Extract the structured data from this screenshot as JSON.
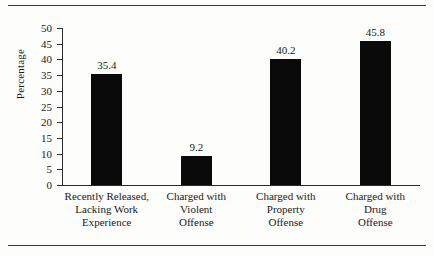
{
  "chart_data": {
    "type": "bar",
    "title": "",
    "xlabel": "",
    "ylabel": "Percentage",
    "ylim": [
      0,
      50
    ],
    "ytick_step": 5,
    "grid": false,
    "legend": "none",
    "bar_color": "#0a0a0a",
    "categories": [
      "Recently Released, Lacking Work Experience",
      "Charged with Violent Offense",
      "Charged with Property Offense",
      "Charged with Drug Offense"
    ],
    "category_lines": [
      [
        "Recently Released,",
        "Lacking Work",
        "Experience"
      ],
      [
        "Charged with",
        "Violent",
        "Offense"
      ],
      [
        "Charged with",
        "Property",
        "Offense"
      ],
      [
        "Charged with",
        "Drug",
        "Offense"
      ]
    ],
    "values": [
      35.4,
      9.2,
      40.2,
      45.8
    ],
    "value_labels": [
      "35.4",
      "9.2",
      "40.2",
      "45.8"
    ],
    "ytick_labels": [
      "50",
      "45",
      "40",
      "35",
      "30",
      "25",
      "20",
      "15",
      "10",
      "5",
      "0"
    ]
  }
}
